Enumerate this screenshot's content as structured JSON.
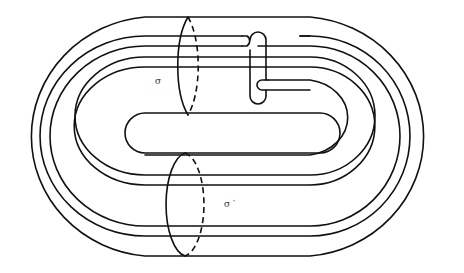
{
  "figure": {
    "labels": {
      "sigma": "σ",
      "sigma_prime": "σ ′"
    },
    "colors": {
      "stroke": "#111111",
      "background": "#ffffff"
    }
  }
}
